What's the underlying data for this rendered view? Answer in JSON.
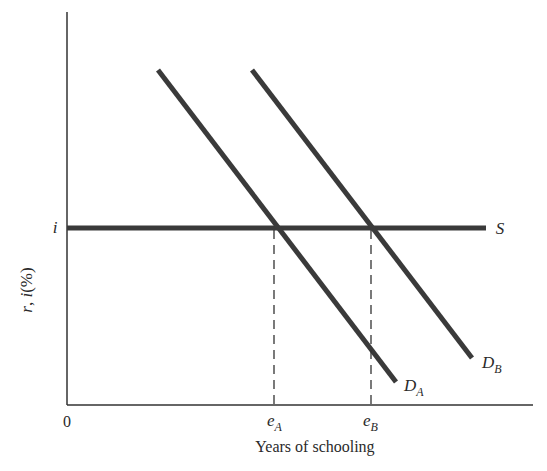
{
  "diagram": {
    "type": "supply-demand",
    "y_axis": {
      "label_r": "r",
      "label_sep": ", ",
      "label_i": "i",
      "label_pct": "(%)"
    },
    "x_axis": {
      "label": "Years of schooling",
      "origin": "0"
    },
    "rate_tick": {
      "label": "i"
    },
    "curves": {
      "supply": {
        "label": "S"
      },
      "demand_a": {
        "label_main": "D",
        "label_sub": "A"
      },
      "demand_b": {
        "label_main": "D",
        "label_sub": "B"
      }
    },
    "equilibria": {
      "a": {
        "label_main": "e",
        "label_sub": "A"
      },
      "b": {
        "label_main": "e",
        "label_sub": "B"
      }
    },
    "colors": {
      "curve": "#333333",
      "axis": "#333333",
      "text": "#2a2a2a"
    }
  }
}
